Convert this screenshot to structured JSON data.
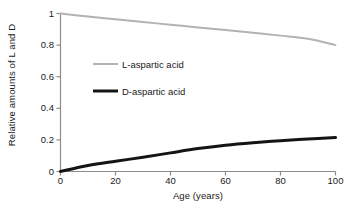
{
  "chart_data": {
    "type": "line",
    "title": "",
    "xlabel": "Age (years)",
    "ylabel": "Relative amounts of L and D",
    "xlim": [
      0,
      100
    ],
    "ylim": [
      0,
      1
    ],
    "xticks": [
      "0",
      "20",
      "40",
      "60",
      "80",
      "100"
    ],
    "xtick_values": [
      0,
      20,
      40,
      60,
      80,
      100
    ],
    "yticks": [
      "0",
      "0.2",
      "0.4",
      "0.6",
      "0.8",
      "1"
    ],
    "ytick_values": [
      0,
      0.2,
      0.4,
      0.6,
      0.8,
      1
    ],
    "grid": false,
    "legend_position": "inside-upper-left",
    "x": [
      0,
      10,
      20,
      30,
      40,
      50,
      60,
      70,
      80,
      90,
      100
    ],
    "series": [
      {
        "name": "L-aspartic acid",
        "color": "#b3b3b3",
        "line_width": 2.0,
        "values": [
          1.0,
          0.981,
          0.963,
          0.946,
          0.929,
          0.912,
          0.895,
          0.878,
          0.86,
          0.84,
          0.8
        ]
      },
      {
        "name": "D-aspartic acid",
        "color": "#141414",
        "line_width": 3.0,
        "values": [
          0.0,
          0.038,
          0.065,
          0.09,
          0.118,
          0.145,
          0.166,
          0.182,
          0.195,
          0.206,
          0.215
        ]
      }
    ],
    "axis_color": "#8c8c8c",
    "background": "#ffffff"
  },
  "legend": {
    "items": [
      {
        "label": "L-aspartic acid",
        "color": "#b3b3b3"
      },
      {
        "label": "D-aspartic acid",
        "color": "#141414"
      }
    ]
  },
  "axes": {
    "x_title": "Age (years)",
    "y_title": "Relative amounts of L and D",
    "x_tick_labels": [
      "0",
      "20",
      "40",
      "60",
      "80",
      "100"
    ],
    "y_tick_labels": [
      "0",
      "0.2",
      "0.4",
      "0.6",
      "0.8",
      "1"
    ]
  }
}
